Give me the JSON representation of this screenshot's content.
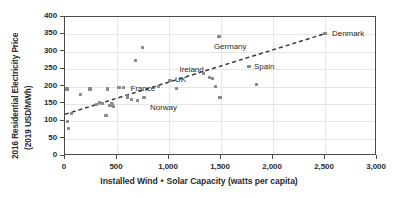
{
  "chart_data": {
    "type": "scatter",
    "title": "",
    "xlabel": "Installed Wind • Solar Capacity (watts per capita)",
    "ylabel_line1": "2016 Residential Electricity Price",
    "ylabel_line2": "(2019 USD/MWh)",
    "xlim": [
      0,
      3000
    ],
    "ylim": [
      0,
      400
    ],
    "xticks": [
      0,
      500,
      1000,
      1500,
      2000,
      2500,
      3000
    ],
    "xtick_labels": [
      "0",
      "500",
      "1,000",
      "1,500",
      "2,000",
      "2,500",
      "3,000"
    ],
    "yticks": [
      0,
      50,
      100,
      150,
      200,
      250,
      300,
      350,
      400
    ],
    "ytick_labels": [
      "0",
      "50",
      "100",
      "150",
      "200",
      "250",
      "300",
      "350",
      "400"
    ],
    "grid": true,
    "legend": false,
    "axis_title_separator": "•",
    "point_color": "#8a8a8a",
    "trendline_color": "#3a3a3a",
    "gridline_color": "#e6e6e6",
    "axis_color": "#4a4a4a",
    "text_color": "#2b2b2b",
    "trendline": {
      "style": "dashed",
      "x0": 0,
      "y0": 120,
      "x1": 2500,
      "y1": 352
    },
    "points": [
      {
        "x": 20,
        "y": 193,
        "label": ""
      },
      {
        "x": 25,
        "y": 100,
        "label": ""
      },
      {
        "x": 30,
        "y": 80,
        "label": ""
      },
      {
        "x": 60,
        "y": 122,
        "label": ""
      },
      {
        "x": 150,
        "y": 178,
        "label": ""
      },
      {
        "x": 240,
        "y": 193,
        "label": ""
      },
      {
        "x": 300,
        "y": 148,
        "label": ""
      },
      {
        "x": 330,
        "y": 155,
        "label": ""
      },
      {
        "x": 360,
        "y": 152,
        "label": ""
      },
      {
        "x": 395,
        "y": 116,
        "label": ""
      },
      {
        "x": 410,
        "y": 193,
        "label": ""
      },
      {
        "x": 430,
        "y": 145,
        "label": ""
      },
      {
        "x": 445,
        "y": 152,
        "label": ""
      },
      {
        "x": 460,
        "y": 147,
        "label": ""
      },
      {
        "x": 470,
        "y": 143,
        "label": ""
      },
      {
        "x": 520,
        "y": 196,
        "label": ""
      },
      {
        "x": 560,
        "y": 197,
        "label": ""
      },
      {
        "x": 600,
        "y": 170,
        "label": ""
      },
      {
        "x": 640,
        "y": 163,
        "label": ""
      },
      {
        "x": 680,
        "y": 275,
        "label": ""
      },
      {
        "x": 700,
        "y": 160,
        "label": ""
      },
      {
        "x": 745,
        "y": 312,
        "label": ""
      },
      {
        "x": 760,
        "y": 168,
        "label": "Norway"
      },
      {
        "x": 900,
        "y": 200,
        "label": "France"
      },
      {
        "x": 1010,
        "y": 218,
        "label": "UK"
      },
      {
        "x": 1070,
        "y": 195,
        "label": ""
      },
      {
        "x": 1330,
        "y": 238,
        "label": ""
      },
      {
        "x": 1390,
        "y": 225,
        "label": "Ireland"
      },
      {
        "x": 1420,
        "y": 222,
        "label": ""
      },
      {
        "x": 1450,
        "y": 200,
        "label": ""
      },
      {
        "x": 1490,
        "y": 168,
        "label": ""
      },
      {
        "x": 1480,
        "y": 345,
        "label": "Germany"
      },
      {
        "x": 1770,
        "y": 258,
        "label": "Spain"
      },
      {
        "x": 1840,
        "y": 205,
        "label": ""
      },
      {
        "x": 2500,
        "y": 352,
        "label": "Denmark"
      }
    ],
    "labels": [
      {
        "text": "Norway",
        "x": 760,
        "y": 168,
        "dx": 6,
        "dy": 11
      },
      {
        "text": "France",
        "x": 900,
        "y": 200,
        "dx": -28,
        "dy": 3
      },
      {
        "text": "UK",
        "x": 1010,
        "y": 218,
        "dx": 5,
        "dy": 1
      },
      {
        "text": "Ireland",
        "x": 1390,
        "y": 225,
        "dx": -30,
        "dy": -7
      },
      {
        "text": "Germany",
        "x": 1480,
        "y": 345,
        "dx": -5,
        "dy": 12
      },
      {
        "text": "Spain",
        "x": 1770,
        "y": 258,
        "dx": 5,
        "dy": 2
      },
      {
        "text": "Denmark",
        "x": 2500,
        "y": 352,
        "dx": 7,
        "dy": 1
      }
    ]
  }
}
